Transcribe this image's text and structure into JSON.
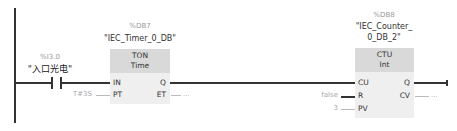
{
  "rung": {
    "contact": {
      "address": "%I3.0",
      "tag": "\"入口光电\""
    },
    "timer": {
      "instance_address": "%DB7",
      "instance_name": "\"IEC_Timer_0_DB\"",
      "type": "TON",
      "datatype": "Time",
      "pins": {
        "in": "IN",
        "pt": "PT",
        "q": "Q",
        "et": "ET"
      },
      "pt_value": "T#3S",
      "et_value": "..."
    },
    "counter": {
      "instance_address": "%DB8",
      "instance_name_line1": "\"IEC_Counter_",
      "instance_name_line2": "0_DB_2\"",
      "type": "CTU",
      "datatype": "Int",
      "pins": {
        "cu": "CU",
        "r": "R",
        "pv": "PV",
        "q": "Q",
        "cv": "CV"
      },
      "r_value": "false",
      "pv_value": "3",
      "cv_value": "..."
    }
  },
  "colors": {
    "wire": "#333333",
    "box_body": "#efefef",
    "box_header": "#d9d9d9",
    "param_text": "#aaaaaa"
  }
}
